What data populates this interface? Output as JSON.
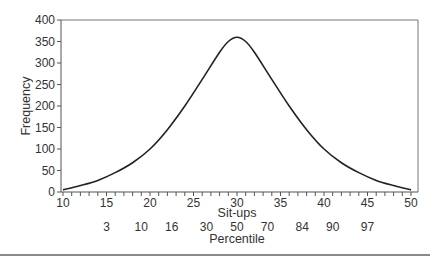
{
  "chart_data": {
    "type": "line",
    "title": "",
    "xlabel": "Sit-ups",
    "ylabel": "Frequency",
    "secondary_xlabel": "Percentile",
    "xlim": [
      10,
      50
    ],
    "ylim": [
      0,
      400
    ],
    "grid": false,
    "legend": null,
    "x_ticks": [
      10,
      15,
      20,
      25,
      30,
      35,
      40,
      45,
      50
    ],
    "y_ticks": [
      0,
      50,
      100,
      150,
      200,
      250,
      300,
      350,
      400
    ],
    "percentile_ticks": [
      {
        "label": "3",
        "x": 15
      },
      {
        "label": "10",
        "x": 19
      },
      {
        "label": "16",
        "x": 22.5
      },
      {
        "label": "30",
        "x": 26.5
      },
      {
        "label": "50",
        "x": 30
      },
      {
        "label": "70",
        "x": 33.5
      },
      {
        "label": "84",
        "x": 37.5
      },
      {
        "label": "90",
        "x": 41
      },
      {
        "label": "97",
        "x": 45
      }
    ],
    "series": [
      {
        "name": "Sit-ups distribution",
        "x": [
          10,
          12,
          14,
          16,
          18,
          20,
          22,
          24,
          26,
          28,
          29,
          30,
          31,
          32,
          34,
          36,
          38,
          40,
          42,
          44,
          46,
          48,
          50
        ],
        "values": [
          5,
          15,
          27,
          45,
          68,
          100,
          145,
          200,
          262,
          325,
          350,
          360,
          350,
          325,
          262,
          200,
          145,
          100,
          68,
          45,
          27,
          15,
          5
        ]
      }
    ]
  },
  "labels": {
    "ylabel": "Frequency",
    "xlabel": "Sit-ups",
    "percentile": "Percentile",
    "y": [
      "0",
      "50",
      "100",
      "150",
      "200",
      "250",
      "300",
      "350",
      "400"
    ],
    "x": [
      "10",
      "15",
      "20",
      "25",
      "30",
      "35",
      "40",
      "45",
      "50"
    ],
    "pct": [
      "3",
      "10",
      "16",
      "30",
      "50",
      "70",
      "84",
      "90",
      "97"
    ]
  }
}
